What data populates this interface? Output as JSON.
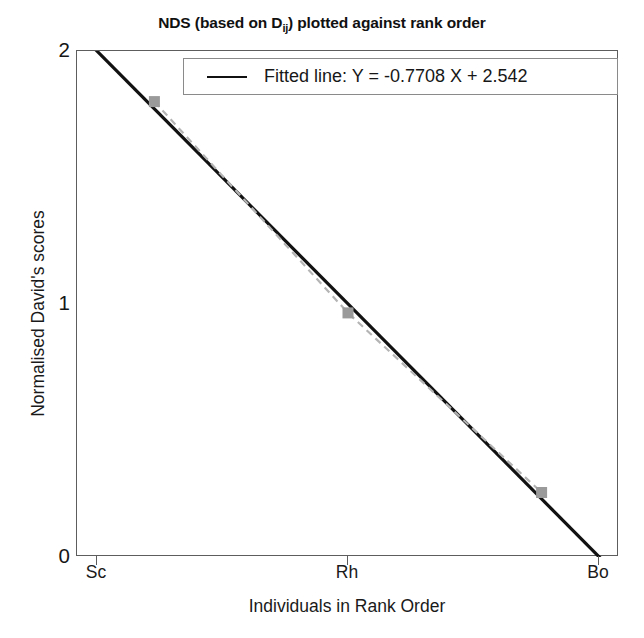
{
  "chart_data": {
    "type": "line",
    "title_main": "NDS (based on D",
    "title_subscript": "ij",
    "title_tail": ") plotted against rank order",
    "xlabel": "Individuals in Rank Order",
    "ylabel": "Normalised David's scores",
    "categories": [
      "Sc",
      "Rh",
      "Bo"
    ],
    "x": [
      1,
      2,
      3
    ],
    "values": [
      1.8,
      0.965,
      0.255
    ],
    "ylim": [
      0,
      2
    ],
    "yticks": [
      "0",
      "1",
      "2"
    ],
    "ytick_values": [
      0,
      1,
      2
    ],
    "xlim": [
      0.6,
      3.4
    ],
    "grid": false,
    "legend_position": "top-right",
    "series": [
      {
        "name": "Normalised David's scores",
        "style": "dashed-with-square-markers",
        "color": "#b4b4b4",
        "marker_color": "#9a9a9a",
        "values": [
          1.8,
          0.965,
          0.255
        ]
      },
      {
        "name": "Fitted line: Y =  -0.7708 X + 2.542",
        "style": "solid",
        "color": "#111111",
        "slope": -0.7708,
        "intercept": 2.542
      }
    ],
    "legend": [
      {
        "label": "Fitted line: Y =  -0.7708 X + 2.542",
        "color": "#111111",
        "marker": "line"
      }
    ],
    "annotations": []
  },
  "colors": {
    "axis": "#5d5d5d",
    "fitted_line": "#111111",
    "data_line": "#b4b4b4",
    "marker": "#9a9a9a",
    "legend_border": "#8a8a8a",
    "background": "#ffffff",
    "text": "#1a1a1a"
  }
}
